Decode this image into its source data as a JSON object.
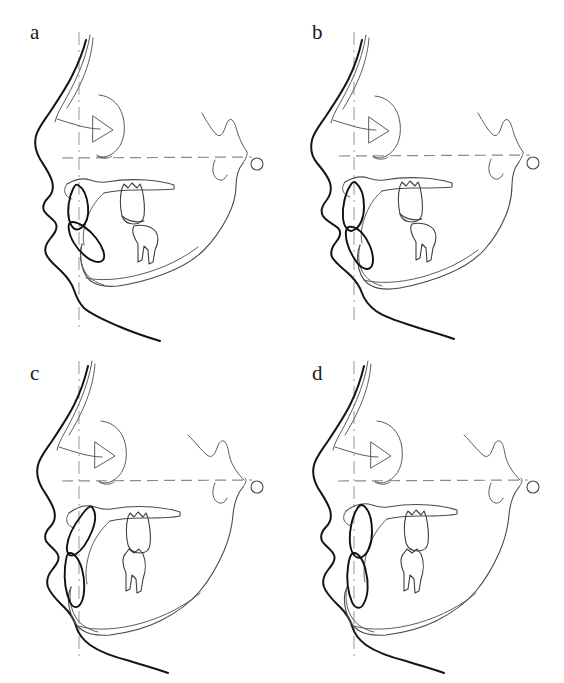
{
  "figure": {
    "background_color": "#ffffff",
    "panel_count": 4,
    "width": 564,
    "height": 683
  },
  "colors": {
    "soft_tissue": "#151515",
    "skeletal": "#5d5d5d",
    "tooth": "#3d3d3d",
    "incisor": "#101010",
    "reference_horizontal": "#8a8a8a",
    "reference_vertical": "#a8a8a8",
    "label": "#1b1b1b",
    "background": "#ffffff"
  },
  "panels": [
    {
      "id": "a",
      "label": "a",
      "label_x": 30,
      "label_y": 30,
      "description": "Lateral cephalometric tracing - soft tissue profile, maxilla, mandible, incisors and molars with Frankfort horizontal and vertical reference lines",
      "features": [
        "soft-tissue-profile",
        "cranial-base",
        "sella-outline",
        "orbit",
        "maxilla",
        "palate",
        "mandible",
        "upper-incisor",
        "lower-incisor",
        "upper-molar",
        "lower-molar",
        "porion-marker",
        "frankfort-horizontal-line",
        "vertical-reference-line"
      ]
    },
    {
      "id": "b",
      "label": "b",
      "label_x": 30,
      "label_y": 30,
      "description": "Lateral cephalometric tracing - retruded mandible variant",
      "features": [
        "soft-tissue-profile",
        "cranial-base",
        "sella-outline",
        "orbit",
        "maxilla",
        "palate",
        "mandible",
        "upper-incisor",
        "lower-incisor",
        "upper-molar",
        "lower-molar",
        "porion-marker",
        "frankfort-horizontal-line",
        "vertical-reference-line"
      ]
    },
    {
      "id": "c",
      "label": "c",
      "label_x": 30,
      "label_y": 30,
      "description": "Lateral cephalometric tracing - proclined incisors variant",
      "features": [
        "soft-tissue-profile",
        "cranial-base",
        "sella-outline",
        "orbit",
        "maxilla",
        "palate",
        "mandible",
        "upper-incisor",
        "lower-incisor",
        "upper-molar",
        "lower-molar",
        "porion-marker",
        "frankfort-horizontal-line",
        "vertical-reference-line"
      ]
    },
    {
      "id": "d",
      "label": "d",
      "label_x": 30,
      "label_y": 30,
      "description": "Lateral cephalometric tracing - upright incisors variant",
      "features": [
        "soft-tissue-profile",
        "cranial-base",
        "sella-outline",
        "orbit",
        "maxilla",
        "palate",
        "mandible",
        "upper-incisor",
        "lower-incisor",
        "upper-molar",
        "lower-molar",
        "porion-marker",
        "frankfort-horizontal-line",
        "vertical-reference-line"
      ]
    }
  ]
}
